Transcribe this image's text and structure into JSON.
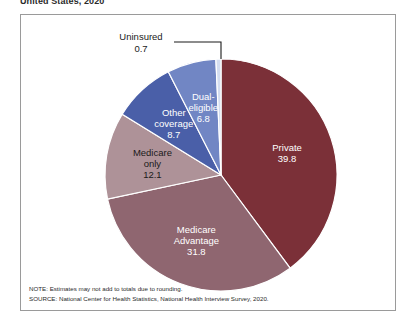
{
  "figure": {
    "title": "United States, 2020"
  },
  "chart_data": {
    "type": "pie",
    "title": "United States, 2020",
    "xlabel": "",
    "ylabel": "",
    "units": "percent",
    "legend_position": "none",
    "labels_inside_slices": true,
    "start_angle_deg": 0,
    "direction": "clockwise",
    "categories": [
      "Private",
      "Medicare Advantage",
      "Medicare only",
      "Other coverage",
      "Dual-eligible",
      "Uninsured"
    ],
    "values": [
      39.8,
      31.8,
      12.1,
      8.7,
      6.8,
      0.7
    ],
    "colors": [
      "#7b3038",
      "#8f6670",
      "#ae9298",
      "#4a5fa8",
      "#7186c4",
      "#d3ddf0"
    ],
    "slices": [
      {
        "name": "Private",
        "label_line1": "Private",
        "label_line2": "39.8",
        "value": 39.8,
        "color": "#7b3038",
        "label_color": "on-dark",
        "label_placement": "inside"
      },
      {
        "name": "Medicare Advantage",
        "label_line1": "Medicare",
        "label_line2": "Advantage",
        "label_line3": "31.8",
        "value": 31.8,
        "color": "#8f6670",
        "label_color": "on-dark",
        "label_placement": "inside"
      },
      {
        "name": "Medicare only",
        "label_line1": "Medicare",
        "label_line2": "only",
        "label_line3": "12.1",
        "value": 12.1,
        "color": "#ae9298",
        "label_color": "on-light",
        "label_placement": "inside"
      },
      {
        "name": "Other coverage",
        "label_line1": "Other",
        "label_line2": "coverage",
        "label_line3": "8.7",
        "value": 8.7,
        "color": "#4a5fa8",
        "label_color": "on-dark",
        "label_placement": "inside"
      },
      {
        "name": "Dual-eligible",
        "label_line1": "Dual-",
        "label_line2": "eligible",
        "label_line3": "6.8",
        "value": 6.8,
        "color": "#7186c4",
        "label_color": "on-dark",
        "label_placement": "inside"
      },
      {
        "name": "Uninsured",
        "label_line1": "Uninsured",
        "label_line2": "0.7",
        "value": 0.7,
        "color": "#d3ddf0",
        "label_color": "on-light",
        "label_placement": "callout"
      }
    ]
  },
  "footnotes": {
    "note": "NOTE: Estimates may not add to totals due to rounding.",
    "source": "SOURCE: National Center for Health Statistics, National Health Interview Survey, 2020."
  }
}
